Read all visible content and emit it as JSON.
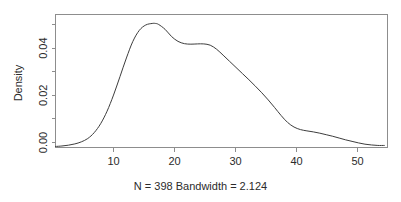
{
  "chart_data": {
    "type": "line",
    "title": "",
    "subtitle": "N = 398   Bandwidth = 2.124",
    "xlabel": "",
    "ylabel": "Density",
    "xlim": [
      2.0,
      53.5
    ],
    "ylim": [
      0.0,
      0.052
    ],
    "grid": false,
    "legend": "none",
    "x_ticks": [
      10,
      20,
      30,
      40,
      50
    ],
    "x_tick_labels": [
      "10",
      "20",
      "30",
      "40",
      "50"
    ],
    "y_ticks": [
      0.0,
      0.01,
      0.02,
      0.03,
      0.04,
      0.05
    ],
    "y_tick_labels": [
      "0.00",
      "",
      "0.02",
      "",
      "0.04",
      ""
    ],
    "n": 398,
    "bandwidth": 2.124,
    "series": [
      {
        "name": "density",
        "color": "#3d3d3d",
        "x": [
          2.0,
          3.0,
          4.0,
          5.0,
          6.0,
          7.0,
          8.0,
          9.0,
          10.0,
          11.0,
          12.0,
          13.0,
          14.0,
          15.0,
          16.0,
          17.0,
          17.5,
          18.0,
          19.0,
          20.0,
          21.0,
          22.0,
          23.0,
          24.0,
          25.0,
          26.0,
          27.0,
          28.0,
          29.0,
          30.0,
          31.0,
          32.0,
          33.0,
          34.0,
          35.0,
          36.0,
          37.0,
          38.0,
          39.0,
          40.0,
          41.0,
          42.0,
          43.0,
          44.0,
          45.0,
          46.0,
          47.0,
          48.0,
          49.0,
          50.0,
          51.0,
          52.0,
          53.0
        ],
        "y": [
          0.0004,
          0.0006,
          0.0009,
          0.0014,
          0.0022,
          0.0035,
          0.0058,
          0.0093,
          0.0142,
          0.0205,
          0.0277,
          0.035,
          0.0415,
          0.0458,
          0.0479,
          0.0485,
          0.0485,
          0.0481,
          0.0462,
          0.0434,
          0.0415,
          0.0406,
          0.0404,
          0.0405,
          0.0405,
          0.04,
          0.0384,
          0.0361,
          0.0337,
          0.0313,
          0.0289,
          0.0265,
          0.024,
          0.0214,
          0.0186,
          0.0156,
          0.0125,
          0.0098,
          0.008,
          0.007,
          0.0065,
          0.0061,
          0.0056,
          0.005,
          0.0044,
          0.0037,
          0.003,
          0.0024,
          0.0018,
          0.0013,
          0.001,
          0.0008,
          0.0008
        ]
      }
    ]
  },
  "plot": {
    "ylabel": "Density",
    "subtitle": "N = 398   Bandwidth = 2.124",
    "title": ""
  }
}
